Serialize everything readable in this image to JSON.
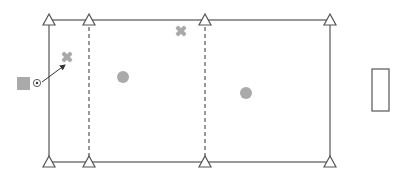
{
  "diagram": {
    "type": "sports-drill-field",
    "colors": {
      "line": "#555555",
      "player": "#aaaaaa",
      "marker_x": "#aaaaaa",
      "cone_fill": "#ffffff",
      "cone_stroke": "#555555",
      "goal_stroke": "#555555",
      "start_square": "#aaaaaa"
    },
    "field": {
      "x": 49,
      "y": 20,
      "width": 281,
      "height": 142
    },
    "dashed_lines": [
      {
        "x": 89
      },
      {
        "x": 205
      }
    ],
    "cones": [
      {
        "x": 49,
        "y": 20
      },
      {
        "x": 89,
        "y": 20
      },
      {
        "x": 205,
        "y": 20
      },
      {
        "x": 330,
        "y": 20
      },
      {
        "x": 49,
        "y": 162
      },
      {
        "x": 89,
        "y": 162
      },
      {
        "x": 205,
        "y": 162
      },
      {
        "x": 330,
        "y": 162
      }
    ],
    "x_markers": [
      {
        "x": 67,
        "y": 57
      },
      {
        "x": 181,
        "y": 31
      }
    ],
    "circle_players": [
      {
        "x": 123,
        "y": 77
      },
      {
        "x": 246,
        "y": 93
      }
    ],
    "start_square": {
      "x": 17,
      "y": 77,
      "size": 13
    },
    "ball": {
      "x": 37,
      "y": 83
    },
    "pass_arrow": {
      "x1": 42,
      "y1": 82,
      "x2": 65,
      "y2": 65
    },
    "goal": {
      "x": 372,
      "y": 69,
      "width": 17,
      "height": 42
    }
  }
}
